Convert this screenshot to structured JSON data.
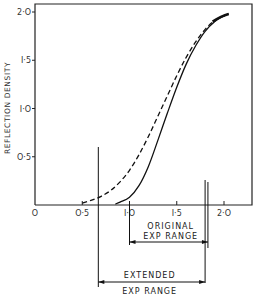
{
  "chart_data": {
    "type": "line",
    "title": "",
    "xlabel": "",
    "ylabel": "REFLECTION DENSITY",
    "xlim": [
      0,
      2.3
    ],
    "ylim": [
      0,
      2.0
    ],
    "grid": false,
    "x_ticks": [
      "O",
      "O·5",
      "I·O",
      "I·5",
      "2·O"
    ],
    "x_tick_values": [
      0,
      0.5,
      1.0,
      1.5,
      2.0
    ],
    "y_ticks": [
      "O·5",
      "I·O",
      "I·5",
      "2·O"
    ],
    "y_tick_values": [
      0.5,
      1.0,
      1.5,
      2.0
    ],
    "series": [
      {
        "name": "extended (dashed)",
        "style": "dashed",
        "x": [
          0.5,
          0.6,
          0.7,
          0.8,
          0.9,
          1.0,
          1.1,
          1.2,
          1.3,
          1.4,
          1.5,
          1.6,
          1.7,
          1.8,
          1.9,
          2.0,
          2.05
        ],
        "y": [
          0.02,
          0.05,
          0.09,
          0.15,
          0.24,
          0.36,
          0.52,
          0.71,
          0.92,
          1.13,
          1.34,
          1.53,
          1.69,
          1.82,
          1.91,
          1.96,
          1.98
        ]
      },
      {
        "name": "original (solid)",
        "style": "solid",
        "x": [
          0.85,
          0.9,
          1.0,
          1.1,
          1.2,
          1.3,
          1.4,
          1.5,
          1.6,
          1.7,
          1.8,
          1.9,
          2.0,
          2.05
        ],
        "y": [
          0.01,
          0.03,
          0.08,
          0.2,
          0.4,
          0.67,
          0.95,
          1.22,
          1.46,
          1.65,
          1.8,
          1.9,
          1.96,
          1.98
        ]
      }
    ],
    "annotations": [
      {
        "label_lines": [
          "ORIGINAL",
          "EXP RANGE"
        ],
        "x_start": 1.0,
        "x_end": 1.83,
        "type": "range-arrow"
      },
      {
        "label_lines": [
          "EXTENDED",
          "EXP RANGE"
        ],
        "x_start": 0.67,
        "x_end": 1.8,
        "type": "range-arrow"
      }
    ],
    "legend": null
  }
}
